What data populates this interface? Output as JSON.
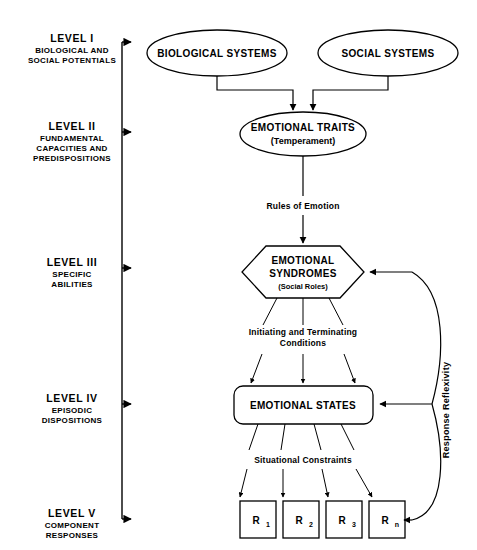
{
  "figure": {
    "background": "#ffffff",
    "ink": "#000000"
  },
  "levels": [
    {
      "id": "level-1",
      "title": "LEVEL  I",
      "subtitle_lines": [
        "BIOLOGICAL AND",
        "SOCIAL POTENTIALS"
      ]
    },
    {
      "id": "level-2",
      "title": "LEVEL  II",
      "subtitle_lines": [
        "FUNDAMENTAL",
        "CAPACITIES AND",
        "PREDISPOSITIONS"
      ]
    },
    {
      "id": "level-3",
      "title": "LEVEL III",
      "subtitle_lines": [
        "SPECIFIC",
        "ABILITIES"
      ]
    },
    {
      "id": "level-4",
      "title": "LEVEL IV",
      "subtitle_lines": [
        "EPISODIC",
        "DISPOSITIONS"
      ]
    },
    {
      "id": "level-5",
      "title": "LEVEL V",
      "subtitle_lines": [
        "COMPONENT",
        "RESPONSES"
      ]
    }
  ],
  "nodes": {
    "biological_systems": {
      "label": "BIOLOGICAL SYSTEMS",
      "shape": "ellipse"
    },
    "social_systems": {
      "label": "SOCIAL SYSTEMS",
      "shape": "ellipse"
    },
    "emotional_traits": {
      "label": "EMOTIONAL TRAITS",
      "sublabel": "(Temperament)",
      "shape": "ellipse"
    },
    "emotional_syndromes": {
      "label_line1": "EMOTIONAL",
      "label_line2": "SYNDROMES",
      "sublabel": "(Social Roles)",
      "shape": "hexagon"
    },
    "emotional_states": {
      "label": "EMOTIONAL STATES",
      "shape": "rounded-rect"
    }
  },
  "responses": [
    {
      "base": "R",
      "sub": "1"
    },
    {
      "base": "R",
      "sub": "2"
    },
    {
      "base": "R",
      "sub": "3"
    },
    {
      "base": "R",
      "sub": "n"
    }
  ],
  "edge_labels": {
    "rules_of_emotion": "Rules of Emotion",
    "initiating_line1": "Initiating and Terminating",
    "initiating_line2": "Conditions",
    "situational_constraints": "Situational Constraints"
  },
  "side_labels": {
    "response_reflexivity": "Response Reflexivity"
  }
}
